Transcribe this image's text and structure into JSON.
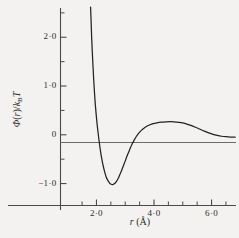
{
  "chart_data": {
    "type": "line",
    "title": "",
    "subtitle": "",
    "xlabel": "r (Å)",
    "ylabel": "Φ(r)/kBT",
    "ylabel_parts": {
      "phi": "Φ",
      "open_paren": "(",
      "r": "r",
      "close_paren": ")",
      "slash": "/",
      "k": "k",
      "b_subscript": "B",
      "t": "T"
    },
    "xlabel_parts": {
      "r": "r",
      "open_paren": "(",
      "angstrom": "Å",
      "close_paren": ")"
    },
    "xlim": [
      0.75,
      6.85
    ],
    "ylim": [
      -1.45,
      2.6
    ],
    "grid": false,
    "legend": null,
    "x_major_ticks": [
      2.0,
      4.0,
      6.0
    ],
    "x_major_tick_labels": [
      "2·0",
      "4·0",
      "6·0"
    ],
    "x_minor_ticks": [
      1.5,
      2.5,
      3.0,
      3.5,
      4.5,
      5.0,
      5.5,
      6.5
    ],
    "y_major_ticks": [
      2.0,
      1.0,
      0.0,
      -1.0
    ],
    "y_major_tick_labels": [
      "2·0",
      "1·0",
      "0",
      "−1·0"
    ],
    "y_minor_ticks": [
      2.5,
      1.5,
      0.5,
      -0.5
    ],
    "zero_line": 0.0,
    "series": [
      {
        "name": "pair potential",
        "points": [
          [
            1.795,
            2.62
          ],
          [
            1.81,
            2.4
          ],
          [
            1.83,
            2.05
          ],
          [
            1.855,
            1.7
          ],
          [
            1.88,
            1.4
          ],
          [
            1.905,
            1.12
          ],
          [
            1.93,
            0.88
          ],
          [
            1.955,
            0.66
          ],
          [
            1.985,
            0.45
          ],
          [
            2.015,
            0.26
          ],
          [
            2.045,
            0.1
          ],
          [
            2.075,
            -0.05
          ],
          [
            2.11,
            -0.21
          ],
          [
            2.15,
            -0.37
          ],
          [
            2.19,
            -0.51
          ],
          [
            2.235,
            -0.64
          ],
          [
            2.285,
            -0.76
          ],
          [
            2.335,
            -0.86
          ],
          [
            2.39,
            -0.93
          ],
          [
            2.45,
            -0.985
          ],
          [
            2.51,
            -1.015
          ],
          [
            2.57,
            -1.02
          ],
          [
            2.63,
            -1.0
          ],
          [
            2.69,
            -0.96
          ],
          [
            2.75,
            -0.9
          ],
          [
            2.81,
            -0.82
          ],
          [
            2.875,
            -0.73
          ],
          [
            2.94,
            -0.63
          ],
          [
            3.01,
            -0.52
          ],
          [
            3.08,
            -0.41
          ],
          [
            3.15,
            -0.31
          ],
          [
            3.23,
            -0.2
          ],
          [
            3.31,
            -0.11
          ],
          [
            3.39,
            -0.03
          ],
          [
            3.47,
            0.035
          ],
          [
            3.56,
            0.09
          ],
          [
            3.65,
            0.135
          ],
          [
            3.75,
            0.175
          ],
          [
            3.86,
            0.205
          ],
          [
            3.97,
            0.228
          ],
          [
            4.1,
            0.245
          ],
          [
            4.25,
            0.258
          ],
          [
            4.42,
            0.266
          ],
          [
            4.6,
            0.268
          ],
          [
            4.78,
            0.262
          ],
          [
            4.95,
            0.248
          ],
          [
            5.12,
            0.224
          ],
          [
            5.28,
            0.192
          ],
          [
            5.44,
            0.154
          ],
          [
            5.6,
            0.113
          ],
          [
            5.75,
            0.074
          ],
          [
            5.9,
            0.038
          ],
          [
            6.05,
            0.008
          ],
          [
            6.2,
            -0.014
          ],
          [
            6.35,
            -0.03
          ],
          [
            6.5,
            -0.04
          ],
          [
            6.65,
            -0.046
          ],
          [
            6.82,
            -0.048
          ]
        ]
      }
    ],
    "annotations": {
      "minimum": {
        "x": 2.57,
        "y": -1.02
      },
      "secondary_maximum": {
        "x": 4.6,
        "y": 0.268
      },
      "zero_crossings": [
        2.09,
        3.42,
        6.07
      ]
    },
    "colors": {
      "background": "#f3f2f0",
      "curve": "#232323",
      "axis": "#4a4a4a",
      "zero_line": "#6b6b6b",
      "text": "#2b2b2b"
    }
  }
}
